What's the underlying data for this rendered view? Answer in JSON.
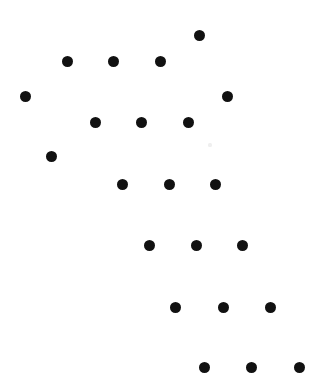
{
  "figure": {
    "type": "scatter-dot-pattern",
    "width": 328,
    "height": 382,
    "background_color": "#ffffff",
    "dot_color": "#111111",
    "dot_radius": 5.5,
    "dot_count": 22,
    "faint_speck_color": "#efefef"
  },
  "chart_data": {
    "type": "scatter",
    "title": "",
    "xlabel": "",
    "ylabel": "",
    "xlim": [
      0,
      328
    ],
    "ylim": [
      0,
      382
    ],
    "grid": false,
    "legend": null,
    "marker": "circle",
    "marker_color": "#111111",
    "marker_radius": 5.5,
    "points": [
      {
        "x": 199,
        "y": 35
      },
      {
        "x": 67,
        "y": 61
      },
      {
        "x": 113,
        "y": 61
      },
      {
        "x": 160,
        "y": 61
      },
      {
        "x": 25,
        "y": 96
      },
      {
        "x": 227,
        "y": 96
      },
      {
        "x": 95,
        "y": 122
      },
      {
        "x": 141,
        "y": 122
      },
      {
        "x": 188,
        "y": 122
      },
      {
        "x": 51,
        "y": 156
      },
      {
        "x": 122,
        "y": 184
      },
      {
        "x": 169,
        "y": 184
      },
      {
        "x": 215,
        "y": 184
      },
      {
        "x": 149,
        "y": 245
      },
      {
        "x": 196,
        "y": 245
      },
      {
        "x": 242,
        "y": 245
      },
      {
        "x": 175,
        "y": 307
      },
      {
        "x": 223,
        "y": 307
      },
      {
        "x": 270,
        "y": 307
      },
      {
        "x": 204,
        "y": 367
      },
      {
        "x": 251,
        "y": 367
      },
      {
        "x": 299,
        "y": 367
      }
    ],
    "specks": [
      {
        "x": 210,
        "y": 145,
        "r": 1.6
      }
    ]
  }
}
